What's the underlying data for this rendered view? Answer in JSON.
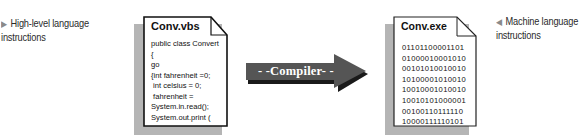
{
  "captions": {
    "left": {
      "icon": "triangle-right-icon",
      "text": "High-level language instructions"
    },
    "right": {
      "icon": "triangle-left-icon",
      "text": "Machine language instructions"
    }
  },
  "source_file": {
    "title": "Conv.vbs",
    "lines": [
      "public class Convert",
      "{",
      "go",
      "{int fahrenheit =0;",
      " int celsius = 0;",
      " fahrenheit =",
      "System.in.read();",
      "System.out.print ("
    ]
  },
  "arrow": {
    "label": "- -Compiler- -"
  },
  "output_file": {
    "title": "Conv.exe",
    "lines": [
      "01101100001101",
      "01000010001010",
      "00101010010010",
      "10100001010010",
      "10010001010010",
      "10010101000001",
      "00100110111110",
      "10000111110101"
    ]
  },
  "colors": {
    "arrow_fill": "#555555",
    "arrow_shadow": "#1a1a1a",
    "doc_shadow": "#b5b5b5",
    "caption_triangle": "#8a8a8a"
  }
}
